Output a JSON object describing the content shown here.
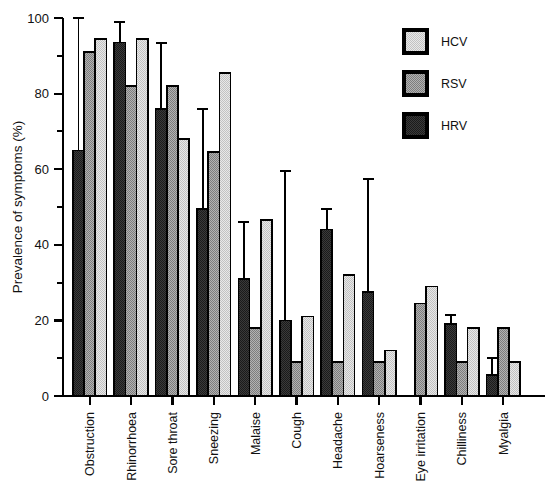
{
  "chart_data": {
    "type": "bar",
    "title": "",
    "subtitle": "",
    "xlabel": "",
    "ylabel": "Prevalence of symptoms (%)",
    "ylim": [
      0,
      100
    ],
    "ytick_values": [
      0,
      20,
      40,
      60,
      80,
      100
    ],
    "ytick_labels": [
      "0",
      "20",
      "40",
      "60",
      "80",
      "100"
    ],
    "yminor_step": 10,
    "grid": false,
    "legend_position": "top-right",
    "categories": [
      "Obstruction",
      "Rhinorrhoea",
      "Sore throat",
      "Sneezing",
      "Malaise",
      "Cough",
      "Headache",
      "Hoarseness",
      "Eye irritation",
      "Chilliness",
      "Myalgia"
    ],
    "bar_order_in_group": [
      "HRV",
      "RSV",
      "HCV"
    ],
    "series": [
      {
        "name": "HRV",
        "color": "#3d3d3d",
        "pattern": "dark-stipple",
        "values": [
          65,
          93.5,
          76,
          49.5,
          31,
          20,
          44,
          27.5,
          null,
          19,
          5.5
        ],
        "errors_upper": [
          100,
          99,
          93.5,
          76,
          46,
          59.5,
          49.5,
          57.5,
          null,
          21.5,
          10
        ]
      },
      {
        "name": "RSV",
        "color": "#9b9b9b",
        "pattern": "medium-stipple",
        "values": [
          91,
          82,
          82,
          64.5,
          18,
          9,
          9,
          9,
          24.5,
          9,
          18
        ],
        "errors_upper": [
          null,
          null,
          null,
          null,
          null,
          null,
          null,
          null,
          null,
          null,
          null
        ]
      },
      {
        "name": "HCV",
        "color": "#dcdcdc",
        "pattern": "light-stipple",
        "values": [
          94.5,
          94.5,
          68,
          85.5,
          46.5,
          21,
          32,
          12,
          29,
          18,
          9
        ],
        "errors_upper": [
          null,
          null,
          null,
          null,
          null,
          null,
          null,
          null,
          null,
          null,
          null
        ]
      }
    ]
  },
  "legend": {
    "entries": [
      {
        "label": "HCV"
      },
      {
        "label": "RSV"
      },
      {
        "label": "HRV"
      }
    ]
  },
  "axes": {
    "y_title": "Prevalence of symptoms (%)"
  }
}
